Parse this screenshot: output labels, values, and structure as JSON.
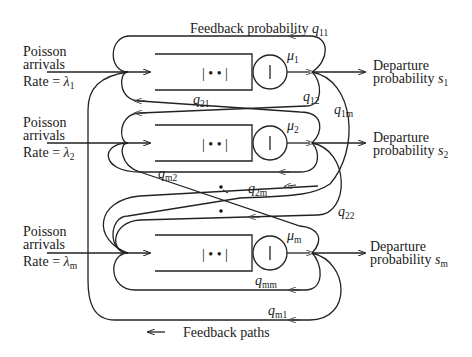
{
  "stations": [
    {
      "id": 1,
      "arrival_label": [
        "Poisson",
        "arrivals"
      ],
      "rate_label": "Rate = ",
      "rate_symbol": "λ",
      "rate_sub": "1",
      "service_symbol": "μ",
      "service_sub": "1",
      "departure_label": [
        "Departure",
        "probability"
      ],
      "departure_symbol": "s",
      "departure_sub": "1"
    },
    {
      "id": 2,
      "arrival_label": [
        "Poisson",
        "arrivals"
      ],
      "rate_label": "Rate = ",
      "rate_symbol": "λ",
      "rate_sub": "2",
      "service_symbol": "μ",
      "service_sub": "2",
      "departure_label": [
        "Departure",
        "probability"
      ],
      "departure_symbol": "s",
      "departure_sub": "2"
    },
    {
      "id": "m",
      "arrival_label": [
        "Poisson",
        "arrivals"
      ],
      "rate_label": "Rate = ",
      "rate_symbol": "λ",
      "rate_sub": "m",
      "service_symbol": "μ",
      "service_sub": "m",
      "departure_label": [
        "Departure",
        "probability"
      ],
      "departure_symbol": "s",
      "departure_sub": "m"
    }
  ],
  "feedback_top_label": "Feedback probability ",
  "transitions": [
    {
      "symbol": "q",
      "sub": "11"
    },
    {
      "symbol": "q",
      "sub": "12"
    },
    {
      "symbol": "q",
      "sub": "1m"
    },
    {
      "symbol": "q",
      "sub": "21"
    },
    {
      "symbol": "q",
      "sub": "22"
    },
    {
      "symbol": "q",
      "sub": "2m"
    },
    {
      "symbol": "q",
      "sub": "m2"
    },
    {
      "symbol": "q",
      "sub": "mm"
    },
    {
      "symbol": "q",
      "sub": "m1"
    }
  ],
  "legend": {
    "arrow_glyph": "←",
    "label": "Feedback paths"
  },
  "queue_glyph": "| • • |",
  "server_glyph": "|",
  "ellipsis_dots": "⋮"
}
